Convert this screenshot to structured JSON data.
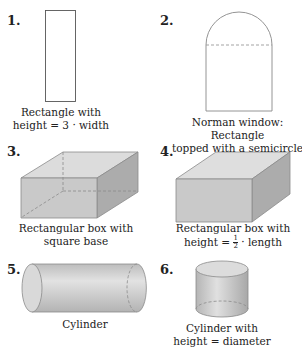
{
  "figures": [
    {
      "number": "1.",
      "caption_line1": "Rectangle with",
      "caption_line2": "height = 3 · width",
      "shape": "rectangle"
    },
    {
      "number": "2.",
      "caption_line1": "Norman window: Rectangle",
      "caption_line2": "topped with a semicircle",
      "shape": "norman-window"
    },
    {
      "number": "3.",
      "caption_line1": "Rectangular box with",
      "caption_line2": "square base",
      "shape": "box-square-base"
    },
    {
      "number": "4.",
      "caption_line1": "Rectangular box with",
      "caption_line2_pre": "height = ",
      "caption_line2_num": "1",
      "caption_line2_den": "2",
      "caption_line2_post": " · length",
      "shape": "box-half-height"
    },
    {
      "number": "5.",
      "caption_line1": "Cylinder",
      "shape": "cylinder"
    },
    {
      "number": "6.",
      "caption_line1": "Cylinder with",
      "caption_line2": "height = diameter",
      "shape": "cylinder-equal"
    }
  ],
  "colors": {
    "stroke": "#7a7a7a",
    "front": "#c8c8c8",
    "top": "#dedede",
    "side": "#a9a9a9"
  }
}
